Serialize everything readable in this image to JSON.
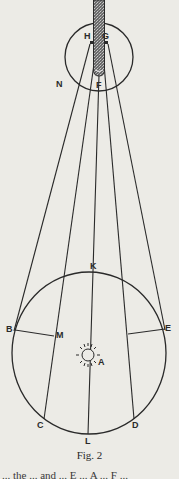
{
  "figure": {
    "caption": "Fig. 2",
    "labels": {
      "H": "H",
      "G": "G",
      "F": "F",
      "N": "N",
      "K": "K",
      "B": "B",
      "M": "M",
      "E": "E",
      "A": "A",
      "C": "C",
      "D": "D",
      "L": "L"
    },
    "elements": {
      "small_circle": "observer circle N",
      "rod": "shaded rod through H G to F",
      "large_circle": "circle BKEDLC",
      "sun": "sun symbol at A",
      "rays": [
        "H-B",
        "G-E",
        "C",
        "L",
        "D"
      ],
      "chords": [
        "B-M",
        "E"
      ]
    },
    "colors": {
      "paper": "#ecebe6",
      "ink": "#2a2a2a",
      "rod_fill": "#555555"
    }
  },
  "page": {
    "next_line_fragment": "... the  ... and ...  E ... A ... F ..."
  }
}
